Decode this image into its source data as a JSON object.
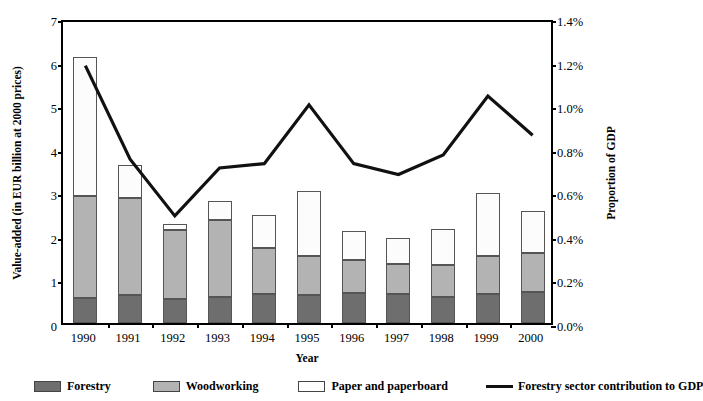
{
  "chart_data": {
    "type": "bar",
    "title": "",
    "subtitle": "",
    "xlabel": "Year",
    "ylabel": "Value-added (in EUR billion at 2000 prices)",
    "y2label": "Proportion of GDP",
    "categories": [
      "1990",
      "1991",
      "1992",
      "1993",
      "1994",
      "1995",
      "1996",
      "1997",
      "1998",
      "1999",
      "2000"
    ],
    "ylim": [
      0,
      7
    ],
    "yticks": [
      "0",
      "1",
      "2",
      "3",
      "4",
      "5",
      "6",
      "7"
    ],
    "y2lim": [
      0,
      1.4
    ],
    "y2ticks": [
      "0.0%",
      "0.2%",
      "0.4%",
      "0.6%",
      "0.8%",
      "1.0%",
      "1.2%",
      "1.4%"
    ],
    "grid": false,
    "stacked": true,
    "legend_position": "bottom",
    "series": [
      {
        "name": "Forestry",
        "kind": "bar-segment",
        "color": "#6e6e6e",
        "values": [
          0.57,
          0.65,
          0.55,
          0.6,
          0.66,
          0.64,
          0.69,
          0.67,
          0.6,
          0.66,
          0.71
        ]
      },
      {
        "name": "Woodworking",
        "kind": "bar-segment",
        "color": "#b3b3b3",
        "values": [
          2.34,
          2.21,
          1.58,
          1.76,
          1.06,
          0.9,
          0.76,
          0.68,
          0.73,
          0.88,
          0.9
        ]
      },
      {
        "name": "Paper and paperboard",
        "kind": "bar-segment",
        "color": "#ffffff",
        "values": [
          3.19,
          0.76,
          0.14,
          0.44,
          0.76,
          1.49,
          0.66,
          0.6,
          0.83,
          1.44,
          0.96
        ]
      },
      {
        "name": "Forestry sector contribution to GDP",
        "kind": "line",
        "color": "#111111",
        "axis": "secondary",
        "unit": "%",
        "values": [
          1.2,
          0.77,
          0.51,
          0.73,
          0.75,
          1.02,
          0.75,
          0.7,
          0.79,
          1.06,
          0.88
        ]
      }
    ],
    "totals": [
      6.1,
      3.62,
      2.27,
      2.8,
      2.48,
      3.03,
      2.11,
      1.95,
      2.16,
      2.98,
      2.57
    ]
  }
}
